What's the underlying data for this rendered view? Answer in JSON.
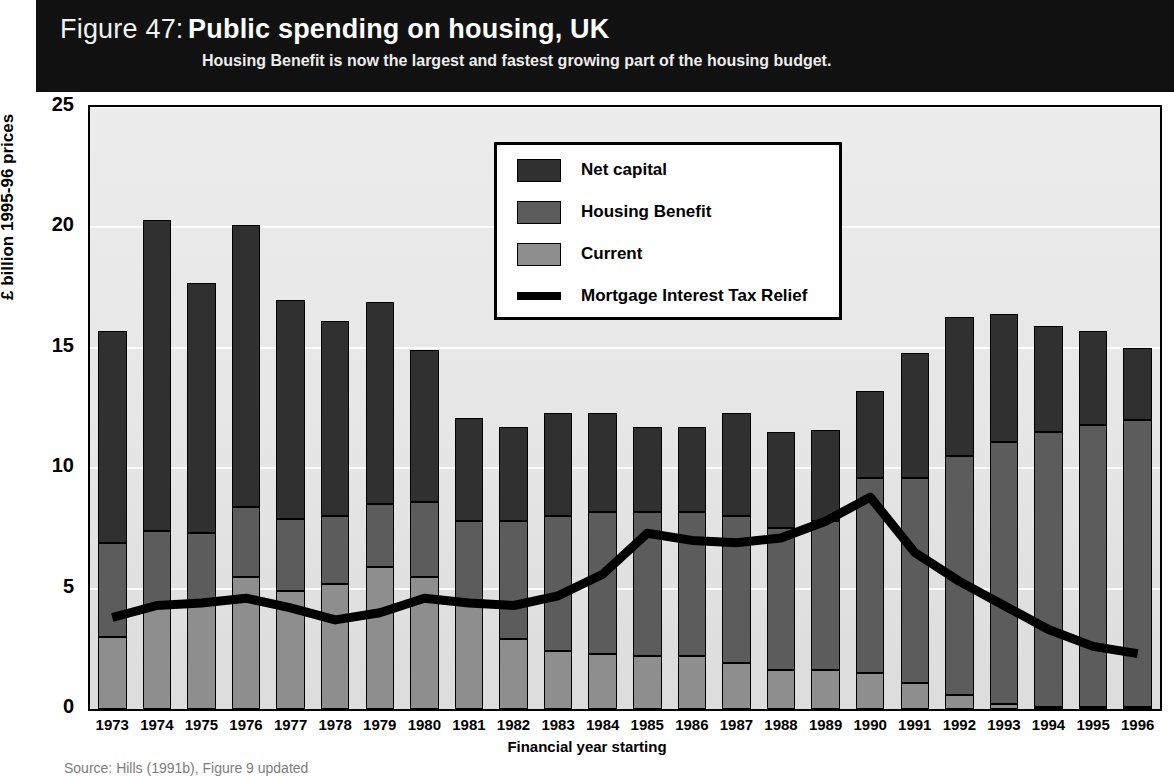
{
  "figure": {
    "number_label": "Figure 47:",
    "title": "Public spending on housing, UK",
    "subtitle": "Housing Benefit is now the largest and fastest growing part of the housing budget.",
    "source": "Source: Hills (1991b), Figure 9 updated"
  },
  "legend": {
    "items": [
      {
        "label": "Net capital",
        "marker": "square",
        "color": "#303030"
      },
      {
        "label": "Housing Benefit",
        "marker": "square",
        "color": "#5c5c5c"
      },
      {
        "label": "Current",
        "marker": "square",
        "color": "#8e8e8e"
      },
      {
        "label": "Mortgage Interest Tax Relief",
        "marker": "line",
        "color": "#000000"
      }
    ],
    "position": "upper-center"
  },
  "chart_data": {
    "type": "bar",
    "subtype": "stacked-bar-with-line-overlay",
    "title": "Public spending on housing, UK",
    "subtitle": "Housing Benefit is now the largest and fastest growing part of the housing budget.",
    "xlabel": "Financial year starting",
    "ylabel": "£ billion 1995-96 prices",
    "ylim": [
      0,
      25
    ],
    "yticks": [
      0,
      5,
      10,
      15,
      20,
      25
    ],
    "ytick_labels": [
      "0",
      "5",
      "10",
      "15",
      "20",
      "25"
    ],
    "grid": "horizontal",
    "categories": [
      "1973",
      "1974",
      "1975",
      "1976",
      "1977",
      "1978",
      "1979",
      "1980",
      "1981",
      "1982",
      "1983",
      "1984",
      "1985",
      "1986",
      "1987",
      "1988",
      "1989",
      "1990",
      "1991",
      "1992",
      "1993",
      "1994",
      "1995",
      "1996"
    ],
    "series": [
      {
        "name": "Current",
        "color": "#8e8e8e",
        "values": [
          3.0,
          4.3,
          4.4,
          5.5,
          4.9,
          5.2,
          5.9,
          5.5,
          4.4,
          2.9,
          2.4,
          2.3,
          2.2,
          2.2,
          1.9,
          1.6,
          1.6,
          1.5,
          1.1,
          0.6,
          0.2,
          0.1,
          0.1,
          0.1
        ]
      },
      {
        "name": "Housing Benefit",
        "color": "#5c5c5c",
        "values": [
          3.9,
          3.1,
          2.9,
          2.9,
          3.0,
          2.8,
          2.6,
          3.1,
          3.4,
          4.9,
          5.6,
          5.9,
          6.0,
          6.0,
          6.1,
          5.9,
          6.2,
          8.1,
          8.5,
          9.9,
          10.9,
          11.4,
          11.7,
          11.9
        ]
      },
      {
        "name": "Net capital",
        "color": "#303030",
        "values": [
          8.8,
          12.9,
          10.4,
          11.7,
          9.1,
          8.1,
          8.4,
          6.3,
          4.3,
          3.9,
          4.3,
          4.1,
          3.5,
          3.5,
          4.3,
          4.0,
          3.8,
          3.6,
          5.2,
          5.8,
          5.3,
          4.4,
          3.9,
          3.0
        ]
      }
    ],
    "totals": [
      15.7,
      20.3,
      17.7,
      20.1,
      17.0,
      16.1,
      16.9,
      14.9,
      12.1,
      11.7,
      12.3,
      12.3,
      11.7,
      11.7,
      12.3,
      11.5,
      11.6,
      13.2,
      14.8,
      16.3,
      16.4,
      15.9,
      15.7,
      15.0
    ],
    "line_series": {
      "name": "Mortgage Interest Tax Relief",
      "color": "#000000",
      "values": [
        3.8,
        4.3,
        4.4,
        4.6,
        4.2,
        3.7,
        4.0,
        4.6,
        4.4,
        4.3,
        4.7,
        5.6,
        7.3,
        7.0,
        6.9,
        7.1,
        7.8,
        8.8,
        6.5,
        5.3,
        4.3,
        3.3,
        2.6,
        2.3
      ]
    }
  }
}
